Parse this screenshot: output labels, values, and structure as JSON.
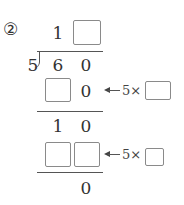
{
  "problem": {
    "label": "②",
    "quotient": {
      "tens": "1",
      "ones": ""
    },
    "divisor": "5",
    "dividend": {
      "tens": "6",
      "ones": "0"
    },
    "step1": {
      "tens": "",
      "ones": "0",
      "hint_prefix": "5×",
      "hint_value": ""
    },
    "remainder1": {
      "tens": "1",
      "ones": "0"
    },
    "step2": {
      "tens": "",
      "ones": "",
      "hint_prefix": "5×",
      "hint_value": ""
    },
    "final_remainder": "0"
  }
}
